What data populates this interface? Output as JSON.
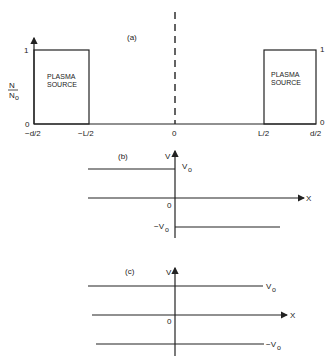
{
  "panel_a": {
    "label": "(a)",
    "y_axis_label_num": "N",
    "y_axis_label_den": "N",
    "y_axis_label_den_sub": "o",
    "y_tick_1": "1",
    "y_tick_0": "0",
    "right_tick_1": "1",
    "right_tick_0": "0",
    "x_ticks": [
      "−d/2",
      "−L/2",
      "0",
      "L/2",
      "d/2"
    ],
    "left_source_line1": "PLASMA",
    "left_source_line2": "SOURCE",
    "right_source_line1": "PLASMA",
    "right_source_line2": "SOURCE"
  },
  "panel_b": {
    "label": "(b)",
    "v_axis": "V",
    "x_axis": "X",
    "origin": "0",
    "upper_value": "V",
    "upper_sub": "o",
    "lower_value": "−V",
    "lower_sub": "o"
  },
  "panel_c": {
    "label": "(c)",
    "v_axis": "V",
    "x_axis": "X",
    "origin": "0",
    "upper_value": "V",
    "upper_sub": "o",
    "lower_value": "−V",
    "lower_sub": "o"
  }
}
